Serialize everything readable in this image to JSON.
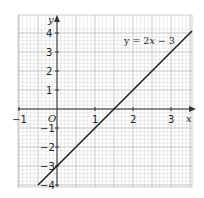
{
  "chart_data": {
    "type": "line",
    "title": "",
    "xlabel": "x",
    "ylabel": "y",
    "origin_label": "O",
    "xlim": [
      -1,
      3.6
    ],
    "ylim": [
      -4.1,
      4.9
    ],
    "grid": true,
    "x_ticks": [
      -1,
      1,
      2,
      3
    ],
    "y_ticks": [
      4,
      3,
      2,
      1,
      -1,
      -2,
      -3,
      -4
    ],
    "series": [
      {
        "name": "y = 2x − 3",
        "equation": "y = 2x − 3",
        "slope": 2,
        "intercept": -3,
        "x": [
          -0.5,
          0,
          1,
          1.5,
          2,
          3,
          3.55
        ],
        "values": [
          -4,
          -3,
          -1,
          0,
          1,
          3,
          4.1
        ]
      }
    ],
    "annotations": [
      {
        "text": "y = 2x − 3",
        "position": "top-right"
      }
    ]
  },
  "labels": {
    "x_axis": "x",
    "y_axis": "y",
    "origin": "O",
    "equation_prefix": "y = 2",
    "equation_x": "x",
    "equation_suffix": " − 3",
    "x_tick_m1": "−1",
    "x_tick_1": "1",
    "x_tick_2": "2",
    "x_tick_3": "3",
    "y_tick_4": "4",
    "y_tick_3": "3",
    "y_tick_2": "2",
    "y_tick_1": "1",
    "y_tick_m1": "−1",
    "y_tick_m2": "−2",
    "y_tick_m3": "−3",
    "y_tick_m4": "−4"
  },
  "colors": {
    "grid_minor": "#d4d4d4",
    "grid_major": "#b0b0b0",
    "axis": "#333333",
    "line": "#222222"
  }
}
